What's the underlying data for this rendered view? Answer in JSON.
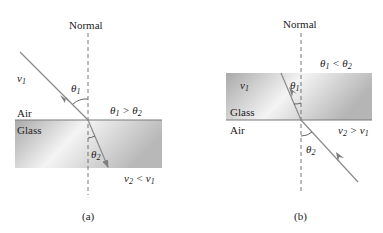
{
  "panels": [
    {
      "id": "a",
      "caption": "(a)",
      "normal_label": "Normal",
      "upper_medium": "Air",
      "lower_medium": "Glass",
      "incident_speed": "v1",
      "angle_incident": "θ1",
      "angle_refracted": "θ2",
      "angle_relation": "θ1 > θ2",
      "speed_relation": "v2 < v1"
    },
    {
      "id": "b",
      "caption": "(b)",
      "normal_label": "Normal",
      "upper_medium": "Glass",
      "lower_medium": "Air",
      "incident_speed": "v1",
      "angle_incident": "θ1",
      "angle_refracted": "θ2",
      "angle_relation": "θ1 < θ2",
      "speed_relation": "v2 > v1"
    }
  ],
  "colors": {
    "glass_dark": "#a8a8a8",
    "glass_light": "#f2f2f2",
    "ray": "#8a8a8a",
    "interface": "#7a7a7a"
  }
}
